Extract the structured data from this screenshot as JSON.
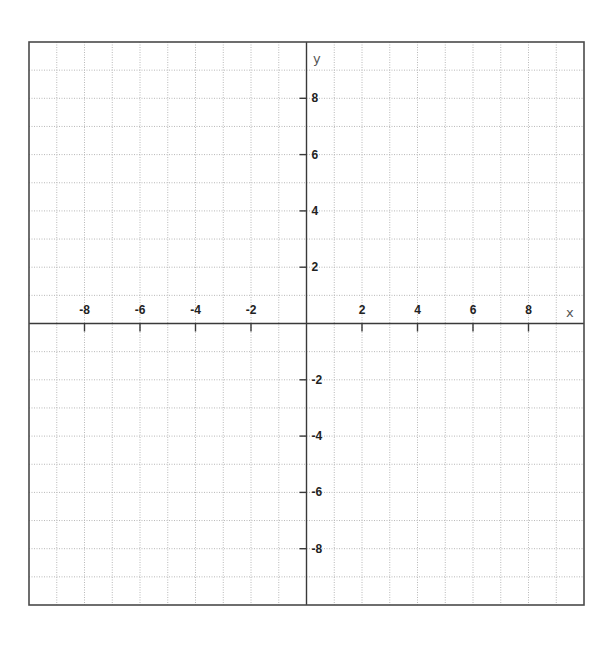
{
  "chart_data": {
    "type": "line",
    "title": "",
    "xlabel": "x",
    "ylabel": "y",
    "xlim": [
      -10,
      10
    ],
    "ylim": [
      -10,
      10
    ],
    "grid": true,
    "grid_step": 1,
    "tick_step": 2,
    "x_ticks": [
      -8,
      -6,
      -4,
      -2,
      2,
      4,
      6,
      8
    ],
    "x_tick_labels": [
      "-8",
      "-6",
      "-4",
      "-2",
      "2",
      "4",
      "6",
      "8"
    ],
    "y_ticks": [
      8,
      6,
      4,
      2,
      -2,
      -4,
      -6,
      -8
    ],
    "y_tick_labels": [
      "8",
      "6",
      "4",
      "2",
      "-2",
      "-4",
      "-6",
      "-8"
    ],
    "series": [],
    "legend": null
  },
  "plot": {
    "x_axis_label": "x",
    "y_axis_label": "y"
  },
  "colors": {
    "background": "#ffffff",
    "grid": "#b8b8b8",
    "axis": "#3a3a3a",
    "border": "#4a4a4a",
    "text": "#222222"
  }
}
